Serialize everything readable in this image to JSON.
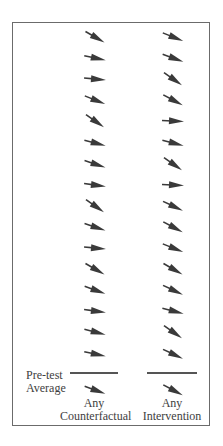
{
  "figure": {
    "columns": [
      {
        "id": "counterfactual",
        "label_line1": "Any",
        "label_line2": "Counterfactual",
        "x": 82,
        "arrow_angles_deg": [
          30,
          12,
          5,
          22,
          35,
          15,
          18,
          8,
          35,
          18,
          5,
          30,
          20,
          8,
          15,
          12
        ],
        "pretest_arrow_angle_deg": 20
      },
      {
        "id": "intervention",
        "label_line1": "Any",
        "label_line2": "Intervention",
        "x": 160,
        "arrow_angles_deg": [
          22,
          20,
          35,
          28,
          3,
          15,
          35,
          3,
          25,
          28,
          22,
          30,
          25,
          15,
          35,
          25
        ],
        "pretest_arrow_angle_deg": 28
      }
    ],
    "row_start_y": 29,
    "row_spacing": 21.1,
    "pretest_line_y": 372,
    "pretest_arrow_y": 382,
    "pretest_label_line1": "Pre-test",
    "pretest_label_line2": "Average",
    "arrow_color": "#3a3a3a",
    "frame_color": "#6b6b6b"
  }
}
